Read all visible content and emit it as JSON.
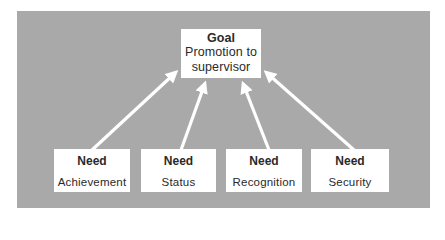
{
  "diagram": {
    "colors": {
      "panel": "#a9a9a9",
      "box": "#ffffff",
      "arrow": "#ffffff",
      "text": "#2a2a2a"
    },
    "goal": {
      "title": "Goal",
      "line1": "Promotion to",
      "line2": "supervisor"
    },
    "needs": [
      {
        "title": "Need",
        "label": "Achievement"
      },
      {
        "title": "Need",
        "label": "Status"
      },
      {
        "title": "Need",
        "label": "Recognition"
      },
      {
        "title": "Need",
        "label": "Security"
      }
    ],
    "edges": [
      {
        "from": "Achievement",
        "to": "Promotion to supervisor"
      },
      {
        "from": "Status",
        "to": "Promotion to supervisor"
      },
      {
        "from": "Recognition",
        "to": "Promotion to supervisor"
      },
      {
        "from": "Security",
        "to": "Promotion to supervisor"
      }
    ]
  }
}
